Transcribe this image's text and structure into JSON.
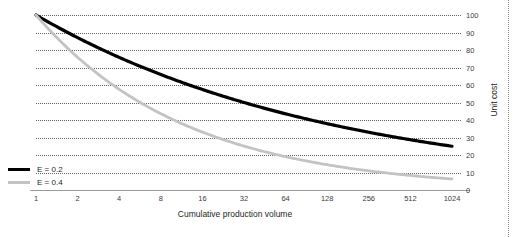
{
  "chart_data": {
    "type": "line",
    "title": "",
    "xlabel": "Cumulative production volume",
    "ylabel": "Unit cost",
    "x": [
      1,
      2,
      4,
      8,
      16,
      32,
      64,
      128,
      256,
      512,
      1024
    ],
    "xticklabels": [
      "1",
      "2",
      "4",
      "8",
      "16",
      "32",
      "64",
      "128",
      "256",
      "512",
      "1024"
    ],
    "xscale": "log2",
    "xlim": [
      1,
      1024
    ],
    "ylim": [
      0,
      100
    ],
    "yticks": [
      0,
      10,
      20,
      30,
      40,
      50,
      60,
      70,
      80,
      90,
      100
    ],
    "yticklabels": [
      "0",
      "10",
      "20",
      "30",
      "40",
      "50",
      "60",
      "70",
      "80",
      "90",
      "100"
    ],
    "grid": "horizontal-dotted",
    "legend_position": "lower-left",
    "formula": "unit cost = 100 x volume^(-E)",
    "series": [
      {
        "name": "E = 0.2",
        "color": "#000000",
        "values": [
          100,
          87,
          75.8,
          66,
          57.4,
          50,
          43.5,
          37.9,
          33,
          28.7,
          25
        ]
      },
      {
        "name": "E = 0.4",
        "color": "#c3c3c3",
        "values": [
          100,
          75.8,
          57.4,
          43.5,
          33,
          25,
          18.9,
          14.4,
          10.9,
          8.3,
          6.3
        ]
      }
    ]
  },
  "axes": {
    "x_title": "Cumulative production volume",
    "y_title": "Unit cost"
  },
  "legend": {
    "items": [
      {
        "label": "E = 0.2",
        "swatch": "line-swatch-dark"
      },
      {
        "label": "E = 0.4",
        "swatch": "line-swatch-light"
      }
    ]
  },
  "clipped_fragment": ""
}
